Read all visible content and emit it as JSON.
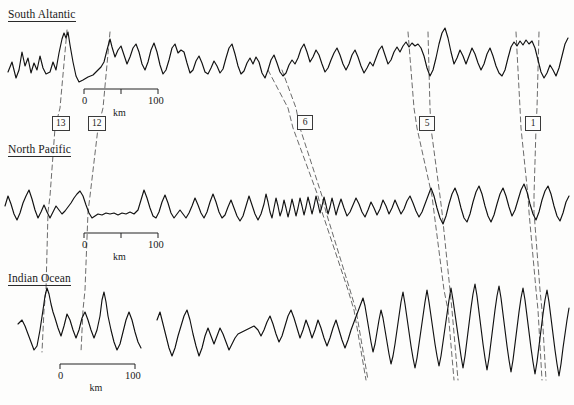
{
  "figure": {
    "type": "magnetic-anomaly-profile-correlation",
    "background_color": "#fdfdfc",
    "trace_color": "#111111",
    "correlation_line_color": "#555555",
    "width": 574,
    "height": 405
  },
  "panels": [
    {
      "id": "south-atlantic",
      "label": "South Altantic",
      "baseline_y": 68
    },
    {
      "id": "north-pacific",
      "label": "North Pacific",
      "baseline_y": 212
    },
    {
      "id": "indian-ocean",
      "label": "Indian Ocean",
      "baseline_y": 345
    }
  ],
  "anomaly_labels": [
    {
      "id": "anomaly-13",
      "text": "13",
      "x": 52,
      "y": 116
    },
    {
      "id": "anomaly-12",
      "text": "12",
      "x": 88,
      "y": 116
    },
    {
      "id": "anomaly-6",
      "text": "6",
      "x": 297,
      "y": 115
    },
    {
      "id": "anomaly-5",
      "text": "5",
      "x": 419,
      "y": 116
    },
    {
      "id": "anomaly-1",
      "text": "1",
      "x": 525,
      "y": 116
    }
  ],
  "scale_bars": [
    {
      "id": "scale-south-atlantic",
      "zero_label": "0",
      "hundred_label": "100",
      "unit_label": "km",
      "x_start": 84,
      "x_end": 158,
      "y": 89,
      "has_mid_tick": true
    },
    {
      "id": "scale-north-pacific",
      "zero_label": "0",
      "hundred_label": "100",
      "unit_label": "km",
      "x_start": 84,
      "x_end": 158,
      "y": 233,
      "has_mid_tick": true
    },
    {
      "id": "scale-indian-ocean",
      "zero_label": "0",
      "hundred_label": "100",
      "unit_label": "km",
      "x_start": 60,
      "x_end": 135,
      "y": 364,
      "has_mid_tick": false
    }
  ],
  "chart_data": {
    "type": "line",
    "title": "",
    "xlabel": "km",
    "ylabel": "",
    "grid": false,
    "legend": "none",
    "series": [
      {
        "name": "South Altantic",
        "baseline_y": 68,
        "path": "M 8,72 L 12,62 L 16,78 L 19,70 L 22,52 L 25,66 L 28,58 L 31,73 L 34,63 L 37,70 L 40,56 L 43,68 L 46,74 L 50,72 L 53,62 L 56,70 L 59,53 L 62,39 L 64,33 L 66,38 L 68,32 L 70,45 L 73,62 L 76,76 L 79,82 L 83,80 L 88,77 L 93,75 L 97,71 L 101,67 L 104,62 L 107,50 L 110,39 L 112,47 L 115,57 L 118,50 L 121,46 L 124,55 L 127,64 L 130,57 L 133,48 L 136,44 L 139,52 L 142,64 L 145,70 L 148,62 L 151,50 L 154,43 L 157,52 L 160,65 L 163,74 L 166,70 L 169,60 L 172,48 L 175,44 L 178,53 L 181,50 L 184,52 L 187,63 L 190,73 L 193,70 L 196,61 L 199,56 L 202,63 L 205,72 L 208,74 L 211,68 L 214,61 L 217,66 L 220,73 L 223,69 L 226,58 L 229,48 L 232,44 L 235,54 L 238,66 L 241,74 L 244,71 L 247,63 L 250,58 L 253,64 L 256,57 L 259,62 L 262,73 L 265,78 L 268,70 L 271,60 L 274,55 L 277,63 L 280,72 L 283,76 L 286,73 L 289,65 L 292,60 L 295,64 L 298,58 L 301,49 L 304,44 L 307,52 L 310,62 L 313,57 L 316,50 L 319,55 L 322,64 L 325,72 L 328,68 L 331,60 L 334,53 L 337,48 L 340,55 L 343,64 L 346,70 L 349,64 L 352,55 L 355,50 L 358,57 L 361,66 L 364,73 L 367,68 L 370,62 L 373,66 L 376,58 L 379,50 L 382,46 L 385,55 L 388,64 L 391,60 L 394,52 L 397,47 L 400,52 L 403,46 L 406,42 L 409,47 L 412,43 L 415,46 L 418,44 L 421,48 L 424,56 L 427,68 L 430,76 L 433,70 L 436,58 L 439,44 L 442,33 L 445,28 L 448,38 L 451,52 L 454,64 L 457,58 L 460,50 L 463,56 L 466,64 L 469,56 L 472,48 L 475,54 L 478,63 L 481,70 L 484,64 L 487,54 L 490,48 L 493,56 L 496,66 L 499,73 L 502,76 L 505,70 L 508,58 L 511,47 L 514,42 L 517,46 L 520,41 L 523,45 L 526,40 L 529,44 L 532,41 L 535,48 L 538,60 L 541,72 L 544,78 L 547,73 L 550,65 L 553,70 L 556,76 L 559,68 L 562,56 L 565,44 L 568,38"
      },
      {
        "name": "North Pacific",
        "baseline_y": 212,
        "path": "M 5,206 L 8,196 L 11,204 L 14,214 L 17,220 L 20,213 L 23,203 L 26,196 L 29,190 L 32,199 L 35,210 L 38,218 L 41,212 L 44,205 L 47,212 L 50,218 L 53,212 L 56,206 L 59,210 L 62,214 L 65,211 L 68,207 L 71,203 L 74,198 L 77,194 L 80,191 L 83,196 L 86,205 L 89,213 L 92,218 L 95,216 L 98,214 L 102,215 L 106,213 L 110,214 L 114,213 L 118,215 L 122,213 L 126,214 L 130,212 L 134,214 L 138,210 L 141,200 L 144,190 L 147,198 L 150,208 L 153,216 L 156,218 L 159,212 L 162,202 L 165,195 L 168,203 L 171,213 L 174,218 L 177,214 L 180,210 L 183,214 L 186,218 L 189,213 L 192,206 L 195,198 L 198,205 L 201,213 L 204,218 L 207,212 L 210,202 L 213,194 L 216,202 L 219,212 L 222,218 L 225,215 L 228,207 L 231,200 L 234,208 L 237,216 L 240,221 L 243,216 L 246,206 L 249,196 L 252,205 L 255,214 L 258,220 L 261,214 L 264,204 L 266,194 L 268,202 L 270,212 L 272,218 L 274,208 L 276,198 L 278,206 L 280,216 L 282,210 L 284,200 L 286,208 L 288,217 L 290,209 L 292,199 L 294,207 L 296,216 L 298,208 L 300,198 L 302,206 L 304,215 L 306,207 L 308,197 L 310,205 L 312,214 L 314,206 L 316,196 L 318,204 L 320,213 L 322,206 L 324,197 L 326,205 L 328,214 L 330,207 L 332,198 L 334,206 L 336,215 L 338,208 L 341,199 L 344,208 L 347,216 L 350,212 L 353,205 L 356,198 L 359,204 L 362,212 L 365,217 L 368,210 L 371,202 L 374,208 L 377,215 L 380,209 L 383,200 L 386,206 L 389,214 L 392,208 L 395,200 L 398,207 L 401,214 L 404,209 L 407,201 L 410,196 L 413,203 L 416,211 L 419,217 L 422,212 L 425,204 L 428,196 L 431,188 L 434,196 L 437,208 L 440,218 L 443,224 L 446,216 L 449,204 L 452,194 L 455,188 L 458,196 L 461,208 L 464,218 L 467,222 L 470,214 L 473,202 L 476,192 L 479,186 L 482,194 L 485,206 L 488,216 L 491,222 L 494,215 L 497,204 L 500,194 L 503,188 L 506,196 L 509,207 L 512,216 L 515,210 L 518,200 L 521,190 L 524,184 L 527,192 L 530,204 L 533,214 L 536,220 L 539,212 L 542,200 L 545,191 L 548,186 L 551,194 L 554,206 L 557,216 L 560,221 L 563,213 L 566,202 L 569,196"
      },
      {
        "name": "Indian Ocean",
        "baseline_y": 345,
        "path": "M 18,324 L 22,320 L 25,326 L 28,334 L 31,342 L 34,350 L 37,346 L 40,330 L 43,310 L 45,296 L 47,288 L 49,294 L 51,304 L 53,312 L 55,318 L 58,328 L 61,336 L 64,326 L 67,314 L 70,320 L 73,330 L 76,338 L 79,330 L 82,318 L 85,312 L 88,320 L 91,330 L 94,338 L 97,330 L 100,316 L 102,300 L 104,292 L 106,302 L 108,316 L 111,330 L 114,342 L 117,350 L 120,344 L 123,332 L 126,320 L 129,312 L 132,320 L 135,332 L 138,342 L 141,348"
      },
      {
        "name": "Indian Ocean (right segment)",
        "baseline_y": 345,
        "path": "M 157,320 L 160,312 L 163,324 L 166,336 L 169,348 L 172,356 L 175,348 L 178,336 L 181,326 L 184,316 L 187,310 L 190,320 L 193,334 L 196,346 L 199,356 L 202,348 L 205,336 L 208,328 L 211,336 L 214,344 L 217,336 L 220,328 L 223,334 L 226,342 L 229,350 L 232,344 L 235,338 L 238,334 L 242,332 L 246,330 L 250,328 L 254,326 L 258,330 L 261,336 L 264,330 L 267,322 L 270,316 L 273,324 L 276,334 L 279,342 L 282,336 L 285,326 L 288,316 L 291,310 L 294,318 L 297,328 L 300,338 L 303,330 L 306,320 L 309,328 L 312,338 L 315,330 L 318,320 L 321,328 L 324,338 L 327,346 L 330,338 L 333,328 L 336,320 L 339,330 L 342,340 L 345,348 L 348,340 L 351,330 L 354,322 L 357,314 L 360,306 L 363,298 L 365,306 L 367,318 L 369,330 L 371,342 L 373,352 L 375,344 L 377,332 L 379,320 L 381,310 L 383,318 L 385,330 L 387,342 L 389,354 L 391,364 L 393,356 L 395,344 L 397,330 L 399,316 L 401,302 L 403,292 L 405,304 L 407,318 L 409,332 L 411,346 L 413,358 L 415,368 L 417,358 L 419,344 L 421,330 L 423,316 L 425,302 L 427,290 L 429,302 L 431,316 L 433,330 L 435,344 L 437,356 L 439,366 L 441,356 L 443,342 L 445,328 L 447,314 L 449,300 L 451,288 L 453,300 L 455,314 L 457,328 L 459,342 L 461,356 L 463,368 L 465,356 L 467,340 L 469,324 L 471,308 L 473,294 L 475,284 L 477,296 L 479,312 L 481,328 L 483,344 L 485,358 L 487,370 L 489,358 L 491,342 L 493,326 L 495,310 L 497,296 L 499,286 L 501,298 L 503,314 L 505,330 L 507,346 L 509,360 L 511,372 L 513,360 L 515,344 L 517,328 L 519,312 L 521,298 L 523,288 L 525,300 L 527,316 L 529,332 L 531,348 L 533,362 L 535,374 L 537,362 L 539,346 L 541,330 L 543,314 L 545,300 L 547,290 L 549,302 L 551,318 L 553,334 L 555,350 L 557,364 L 559,376 L 561,364 L 563,348 L 565,334 L 567,320 L 569,308"
      }
    ],
    "correlation_lines": [
      {
        "anomaly": "13",
        "points": "67,30 60,108 55,128 50,196 48,212 46,290 44,310 42,352"
      },
      {
        "anomaly": "12",
        "points": "110,32 103,108 98,128 90,196 88,212 85,290 83,310 81,352"
      },
      {
        "anomaly": "6a",
        "points": "282,70 296,108 300,128 322,196 326,212 350,290 356,310 368,380"
      },
      {
        "anomaly": "6b",
        "points": "268,70 288,108 293,128 318,196 322,212 348,290 354,310 366,380"
      },
      {
        "anomaly": "5a",
        "points": "408,32 414,108 417,128 432,196 434,212 444,290 448,310 454,380"
      },
      {
        "anomaly": "5b",
        "points": "428,32 430,108 431,128 440,196 442,212 450,290 452,310 458,380"
      },
      {
        "anomaly": "1a",
        "points": "516,32 520,108 521,128 528,196 529,212 536,290 538,310 542,380"
      },
      {
        "anomaly": "1b",
        "points": "539,32 537,108 536,128 534,196 534,212 540,290 542,310 546,380"
      }
    ]
  }
}
